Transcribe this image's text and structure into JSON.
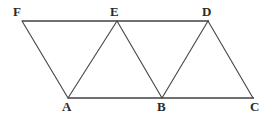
{
  "figure": {
    "background_color": "#ffffff",
    "line_color": "#4a4a4a",
    "baseline_color": "#707070",
    "label_color": "#2b2b2b",
    "canvas": {
      "width": 276,
      "height": 118
    },
    "vertices": [
      {
        "id": "F",
        "label": "F",
        "x": 22,
        "y": 21,
        "label_x": 13,
        "label_y": 5,
        "row": "top"
      },
      {
        "id": "E",
        "label": "E",
        "x": 117,
        "y": 21,
        "label_x": 110,
        "label_y": 5,
        "row": "top"
      },
      {
        "id": "D",
        "label": "D",
        "x": 208,
        "y": 21,
        "label_x": 202,
        "label_y": 5,
        "row": "top"
      },
      {
        "id": "A",
        "label": "A",
        "x": 68,
        "y": 98,
        "label_x": 62,
        "label_y": 100,
        "row": "bottom"
      },
      {
        "id": "B",
        "label": "B",
        "x": 162,
        "y": 98,
        "label_x": 157,
        "label_y": 100,
        "row": "bottom"
      },
      {
        "id": "C",
        "label": "C",
        "x": 253,
        "y": 98,
        "label_x": 250,
        "label_y": 100,
        "row": "bottom"
      }
    ],
    "segments": [
      {
        "name": "F-E",
        "from": "F",
        "to": "E",
        "x1": 22,
        "y1": 21,
        "x2": 117,
        "y2": 21,
        "kind": "base"
      },
      {
        "name": "E-D",
        "from": "E",
        "to": "D",
        "x1": 117,
        "y1": 21,
        "x2": 209,
        "y2": 21,
        "kind": "base"
      },
      {
        "name": "A-B",
        "from": "A",
        "to": "B",
        "x1": 68,
        "y1": 98,
        "x2": 162,
        "y2": 98,
        "kind": "base"
      },
      {
        "name": "B-C",
        "from": "B",
        "to": "C",
        "x1": 162,
        "y1": 98,
        "x2": 254,
        "y2": 98,
        "kind": "base"
      },
      {
        "name": "F-A",
        "from": "F",
        "to": "A",
        "x1": 22,
        "y1": 21,
        "x2": 68,
        "y2": 98,
        "kind": "diagonal"
      },
      {
        "name": "A-E",
        "from": "A",
        "to": "E",
        "x1": 68,
        "y1": 98,
        "x2": 117,
        "y2": 21,
        "kind": "diagonal"
      },
      {
        "name": "E-B",
        "from": "E",
        "to": "B",
        "x1": 117,
        "y1": 21,
        "x2": 162,
        "y2": 98,
        "kind": "diagonal"
      },
      {
        "name": "B-D",
        "from": "B",
        "to": "D",
        "x1": 162,
        "y1": 98,
        "x2": 208,
        "y2": 21,
        "kind": "diagonal"
      },
      {
        "name": "D-C",
        "from": "D",
        "to": "C",
        "x1": 208,
        "y1": 21,
        "x2": 253,
        "y2": 98,
        "kind": "diagonal"
      }
    ]
  }
}
